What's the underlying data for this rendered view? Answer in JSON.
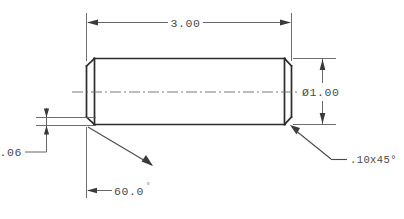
{
  "drawing": {
    "title": "Dowel Pin Detail Drawing",
    "part_name": "dowel-pin",
    "units_note": "inches",
    "background_color": "#ffffff",
    "line_color": "#2b2b2b",
    "dimension_color": "#4a4a4a"
  },
  "dimensions": {
    "overall_length": {
      "name": "overall-length-dimension",
      "value": "3.00",
      "type": "linear-horizontal",
      "position": "top"
    },
    "diameter": {
      "name": "diameter-dimension",
      "symbol": "Ø",
      "value": "1.00",
      "display": "Ø1.00",
      "type": "linear-vertical",
      "position": "right"
    },
    "chamfer_width": {
      "name": "chamfer-width-dimension",
      "value": ".06",
      "type": "linear-vertical-small",
      "position": "left"
    },
    "point_angle": {
      "name": "point-angle-dimension",
      "value": "60.0",
      "unit": "°",
      "display": "60.0°",
      "type": "angular",
      "position": "bottom-left"
    },
    "chamfer_note": {
      "name": "chamfer-note",
      "size": ".10",
      "separator": "x",
      "angle": "45",
      "unit": "°",
      "display": ".10x45°",
      "type": "leader-note",
      "position": "bottom-right"
    }
  },
  "geometry": {
    "body": {
      "name": "pin-body",
      "left_x": 86,
      "right_x": 292,
      "top_y": 58,
      "bottom_y": 125,
      "chamfer_offset": 8
    },
    "centerline": {
      "name": "axis-centerline",
      "y": 92,
      "start_x": 72,
      "end_x": 310
    }
  }
}
